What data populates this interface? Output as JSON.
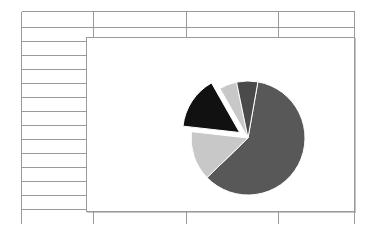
{
  "app": {
    "type": "spreadsheet-with-embedded-chart",
    "background_color": "#ffffff"
  },
  "sheet": {
    "name": "worksheet-grid",
    "grid_line_color": "#9a9a9a",
    "columns": 4,
    "rows": 13,
    "column_divider_x": [
      93,
      186,
      278
    ],
    "row_divider_y": [
      11,
      27,
      41,
      55,
      69,
      83,
      97,
      111,
      125,
      139,
      153,
      167,
      181,
      195,
      209,
      224
    ],
    "cells": []
  },
  "chart_object": {
    "name": "embedded-chart",
    "frame_color": "#9a9a9a",
    "background_color": "#ffffff",
    "selected": false
  },
  "chart_data": {
    "type": "pie",
    "title": "",
    "subtitle": "",
    "xlabel": "",
    "ylabel": "",
    "legend_position": "none",
    "grid": false,
    "labels": [
      "Series 1",
      "Series 2",
      "Series 3",
      "Series 4",
      "Series 5"
    ],
    "values": [
      60,
      14,
      15,
      5,
      6
    ],
    "colors": [
      "#585858",
      "#c8c8c8",
      "#111111",
      "#c8c8c8",
      "#4a4a4a"
    ],
    "exploded": [
      false,
      false,
      true,
      false,
      false
    ],
    "explode_offset": 10,
    "start_angle": -80,
    "direction": "clockwise",
    "center": {
      "x": 161,
      "y": 100
    },
    "radius": 57,
    "slice_border_color": "#ffffff",
    "slice_border_width": 1
  }
}
